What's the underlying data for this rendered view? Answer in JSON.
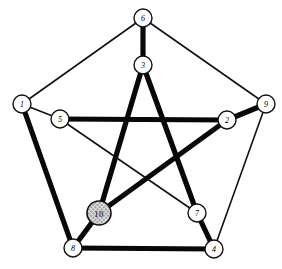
{
  "figure": {
    "width": 282,
    "height": 269,
    "background_color": "#ffffff",
    "edge_colors": {
      "thin": "#111111",
      "thick": "#080808"
    },
    "highlight_fill": "#b9b9b9"
  },
  "chart_data": {
    "type": "diagram",
    "title": "",
    "xlabel": "",
    "ylabel": "",
    "nodes": [
      {
        "id": "1",
        "label": "1",
        "x": 22,
        "y": 104,
        "r": 9,
        "style": "plain",
        "ring": "outer"
      },
      {
        "id": "2",
        "label": "2",
        "x": 227,
        "y": 120,
        "r": 9,
        "style": "plain",
        "ring": "inner"
      },
      {
        "id": "3",
        "label": "3",
        "x": 143,
        "y": 65,
        "r": 9,
        "style": "plain",
        "ring": "inner"
      },
      {
        "id": "4",
        "label": "4",
        "x": 214,
        "y": 249,
        "r": 9,
        "style": "plain",
        "ring": "outer"
      },
      {
        "id": "5",
        "label": "5",
        "x": 60,
        "y": 119,
        "r": 9,
        "style": "plain",
        "ring": "inner"
      },
      {
        "id": "6",
        "label": "6",
        "x": 143,
        "y": 18,
        "r": 9,
        "style": "plain",
        "ring": "outer"
      },
      {
        "id": "7",
        "label": "7",
        "x": 197,
        "y": 213,
        "r": 9,
        "style": "plain",
        "ring": "inner"
      },
      {
        "id": "8",
        "label": "8",
        "x": 73,
        "y": 248,
        "r": 9,
        "style": "plain",
        "ring": "outer"
      },
      {
        "id": "9",
        "label": "9",
        "x": 266,
        "y": 104,
        "r": 9,
        "style": "plain",
        "ring": "outer"
      },
      {
        "id": "10",
        "label": "10",
        "x": 99,
        "y": 213,
        "r": 12,
        "style": "hatched",
        "ring": "inner"
      }
    ],
    "edges": [
      {
        "from": "1",
        "to": "6",
        "weight": "thin",
        "group": "outer-pentagon"
      },
      {
        "from": "6",
        "to": "9",
        "weight": "thin",
        "group": "outer-pentagon"
      },
      {
        "from": "9",
        "to": "4",
        "weight": "thin",
        "group": "outer-pentagon"
      },
      {
        "from": "4",
        "to": "8",
        "weight": "thick",
        "group": "outer-pentagon"
      },
      {
        "from": "8",
        "to": "1",
        "weight": "thick",
        "group": "outer-pentagon"
      },
      {
        "from": "1",
        "to": "5",
        "weight": "thin",
        "group": "spoke"
      },
      {
        "from": "6",
        "to": "3",
        "weight": "thick",
        "group": "spoke"
      },
      {
        "from": "9",
        "to": "2",
        "weight": "thick",
        "group": "spoke"
      },
      {
        "from": "4",
        "to": "7",
        "weight": "thick",
        "group": "spoke"
      },
      {
        "from": "8",
        "to": "10",
        "weight": "thick",
        "group": "spoke"
      },
      {
        "from": "5",
        "to": "2",
        "weight": "thick",
        "group": "inner-pentagram"
      },
      {
        "from": "2",
        "to": "10",
        "weight": "thick",
        "group": "inner-pentagram"
      },
      {
        "from": "10",
        "to": "3",
        "weight": "thick",
        "group": "inner-pentagram"
      },
      {
        "from": "3",
        "to": "7",
        "weight": "thick",
        "group": "inner-pentagram"
      },
      {
        "from": "7",
        "to": "5",
        "weight": "thin",
        "group": "inner-pentagram"
      }
    ],
    "node_count": 10,
    "edge_count": 15,
    "thick_edge_count": 11,
    "thin_edge_count": 4
  }
}
